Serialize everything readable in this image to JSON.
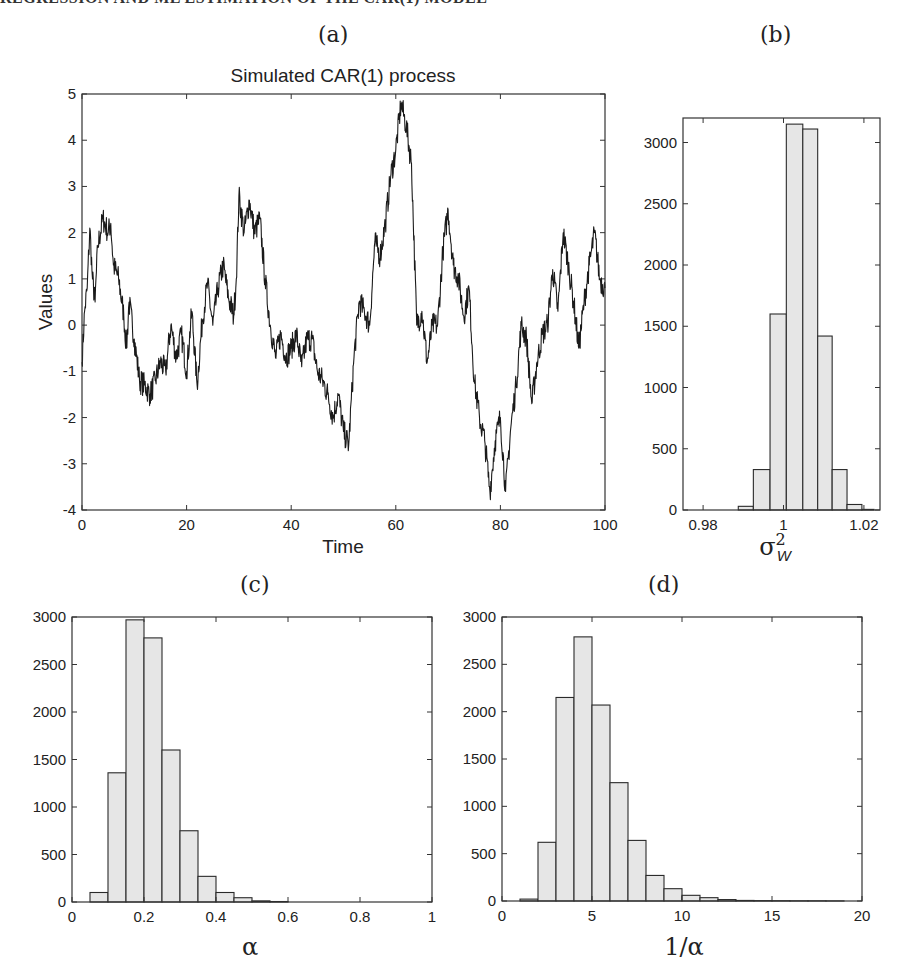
{
  "header": {
    "text": "REGRESSION AND ML ESTIMATION OF THE CAR(1) MODEL"
  },
  "panels": {
    "a": {
      "label": "(a)"
    },
    "b": {
      "label": "(b)"
    },
    "c": {
      "label": "(c)"
    },
    "d": {
      "label": "(d)"
    }
  },
  "colors": {
    "bar_fill": "#e6e6e6",
    "bar_edge": "#2a2a2a",
    "line": "#1a1a1a",
    "axis": "#333333"
  },
  "chart_data": [
    {
      "id": "a",
      "type": "line",
      "title": "Simulated CAR(1) process",
      "xlabel": "Time",
      "ylabel": "Values",
      "xlim": [
        0,
        100
      ],
      "ylim": [
        -4,
        5
      ],
      "xticks": [
        0,
        20,
        40,
        60,
        80,
        100
      ],
      "yticks": [
        -4,
        -3,
        -2,
        -1,
        0,
        1,
        2,
        3,
        4,
        5
      ],
      "grid": false,
      "x": [
        0,
        0.5,
        1,
        1.5,
        2,
        2.5,
        3,
        4,
        5,
        5.5,
        6,
        7,
        8,
        8.5,
        9,
        10,
        11,
        12,
        13,
        14,
        15,
        16,
        17,
        18,
        19,
        20,
        21,
        22,
        23,
        24,
        25,
        26,
        27,
        28,
        29,
        29.5,
        30,
        31,
        32,
        33,
        34,
        35,
        36,
        37,
        38,
        39,
        40,
        41,
        42,
        43,
        44,
        45,
        46,
        47,
        48,
        49,
        50,
        51,
        52,
        53,
        54,
        55,
        56,
        57,
        58,
        59,
        60,
        61,
        62,
        63,
        64,
        65,
        66,
        67,
        68,
        69,
        70,
        71,
        72,
        73,
        74,
        75,
        76,
        77,
        78,
        79,
        80,
        81,
        82,
        83,
        84,
        85,
        86,
        87,
        88,
        89,
        90,
        91,
        92,
        93,
        94,
        95,
        96,
        97,
        98,
        99,
        100
      ],
      "y": [
        -0.8,
        0.3,
        0.8,
        2.1,
        1.0,
        0.5,
        1.7,
        2.3,
        2.0,
        2.2,
        1.3,
        1.0,
        0.2,
        -0.5,
        0.5,
        -0.3,
        -1.2,
        -1.3,
        -1.5,
        -1.2,
        -0.8,
        -1.0,
        0.0,
        -0.7,
        -0.2,
        -1.0,
        0.3,
        -1.3,
        0.1,
        0.9,
        0.0,
        0.8,
        1.3,
        0.6,
        0.2,
        1.0,
        2.8,
        2.0,
        2.7,
        2.0,
        2.3,
        1.0,
        0.0,
        -0.7,
        -0.2,
        -0.7,
        -0.5,
        -0.2,
        -0.9,
        -0.3,
        -0.3,
        -1.0,
        -1.2,
        -1.5,
        -2.0,
        -1.5,
        -2.3,
        -2.6,
        -0.7,
        0.5,
        0.3,
        0.0,
        1.8,
        1.5,
        2.2,
        3.2,
        3.8,
        4.8,
        4.3,
        3.5,
        0.0,
        0.3,
        -0.8,
        0.0,
        0.0,
        1.6,
        2.5,
        1.3,
        1.0,
        0.2,
        0.8,
        -1.2,
        -2.0,
        -2.5,
        -3.6,
        -2.5,
        -2.0,
        -3.6,
        -2.2,
        -1.3,
        0.0,
        -0.3,
        -1.7,
        -0.8,
        -0.2,
        0.0,
        1.2,
        0.3,
        2.0,
        1.3,
        0.5,
        -0.5,
        0.5,
        1.3,
        2.0,
        1.0,
        0.8
      ]
    },
    {
      "id": "b",
      "type": "bar",
      "title": "",
      "xlabel": "σ²_W",
      "xlabel_main": "σ",
      "xlabel_sup": "2",
      "xlabel_sub": "W",
      "ylabel": "",
      "xlim": [
        0.975,
        1.024
      ],
      "ylim": [
        0,
        3200
      ],
      "xticks": [
        0.98,
        1,
        1.02
      ],
      "xtick_labels": [
        "0.98",
        "1",
        "1.02"
      ],
      "yticks": [
        0,
        500,
        1000,
        1500,
        2000,
        2500,
        3000
      ],
      "bin_edges": [
        0.98875,
        0.9925,
        0.99665,
        1.0007,
        1.0048,
        1.0085,
        1.0121,
        1.0158,
        1.0195,
        1.0225
      ],
      "values": [
        30,
        330,
        1600,
        3150,
        3110,
        1420,
        330,
        45,
        5
      ]
    },
    {
      "id": "c",
      "type": "bar",
      "title": "",
      "xlabel": "α",
      "ylabel": "",
      "xlim": [
        0,
        1
      ],
      "ylim": [
        0,
        3000
      ],
      "xticks": [
        0,
        0.2,
        0.4,
        0.6,
        0.8,
        1
      ],
      "xtick_labels": [
        "0",
        "0.2",
        "0.4",
        "0.6",
        "0.8",
        "1"
      ],
      "yticks": [
        0,
        500,
        1000,
        1500,
        2000,
        2500,
        3000
      ],
      "bin_edges": [
        0.05,
        0.1,
        0.15,
        0.2,
        0.25,
        0.3,
        0.35,
        0.4,
        0.45,
        0.5,
        0.55,
        0.6
      ],
      "values": [
        100,
        1360,
        2970,
        2780,
        1600,
        750,
        270,
        100,
        45,
        12,
        5
      ]
    },
    {
      "id": "d",
      "type": "bar",
      "title": "",
      "xlabel": "1/α",
      "ylabel": "",
      "xlim": [
        0,
        20
      ],
      "ylim": [
        0,
        3000
      ],
      "xticks": [
        0,
        5,
        10,
        15,
        20
      ],
      "xtick_labels": [
        "0",
        "5",
        "10",
        "15",
        "20"
      ],
      "yticks": [
        0,
        500,
        1000,
        1500,
        2000,
        2500,
        3000
      ],
      "bin_edges": [
        1,
        2,
        3,
        4,
        5,
        6,
        7,
        8,
        9,
        10,
        11,
        12,
        13,
        14,
        15,
        16,
        17,
        18,
        19
      ],
      "values": [
        20,
        620,
        2150,
        2790,
        2070,
        1250,
        640,
        270,
        130,
        60,
        35,
        15,
        6,
        4,
        3,
        2,
        2,
        1
      ]
    }
  ]
}
